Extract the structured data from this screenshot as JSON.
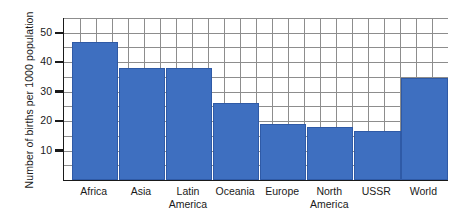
{
  "chart_data": {
    "type": "bar",
    "title": "",
    "subtitle": "",
    "xlabel": "",
    "ylabel": "Number of births per 1000 population",
    "ylim": [
      0,
      55
    ],
    "grid": true,
    "legend": "none",
    "bar_color": "#3e6fc0",
    "bar_border_color": "#2f5aa6",
    "grid_color": "#8d8d8d",
    "axis_color": "#1a1a1a",
    "y_ticks": [
      10,
      20,
      30,
      40,
      50
    ],
    "y_tick_labels": [
      "10",
      "20",
      "30",
      "40",
      "50"
    ],
    "y_minor_step": 5,
    "categories": [
      "Africa",
      "Asia",
      "Latin America",
      "Oceania",
      "Europe",
      "North America",
      "USSR",
      "World"
    ],
    "category_lines": [
      [
        "Africa",
        ""
      ],
      [
        "Asia",
        ""
      ],
      [
        "Latin",
        "America"
      ],
      [
        "Oceania",
        ""
      ],
      [
        "Europe",
        ""
      ],
      [
        "North",
        "America"
      ],
      [
        "USSR",
        ""
      ],
      [
        "World",
        ""
      ]
    ],
    "values": [
      47,
      38,
      38,
      26,
      19,
      18,
      16.5,
      34.5
    ]
  }
}
